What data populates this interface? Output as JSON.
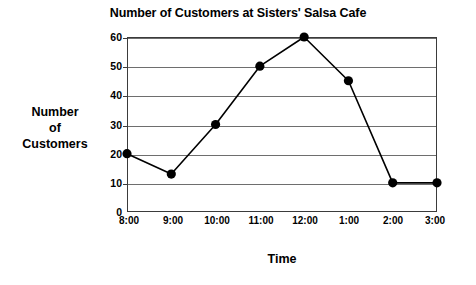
{
  "chart_data": {
    "type": "line",
    "title": "Number of Customers at Sisters' Salsa Cafe",
    "xlabel": "Time",
    "ylabel": "Number of Customers",
    "ylabel_lines": [
      "Number",
      "of",
      "Customers"
    ],
    "categories": [
      "8:00",
      "9:00",
      "10:00",
      "11:00",
      "12:00",
      "1:00",
      "2:00",
      "3:00"
    ],
    "values": [
      20,
      13,
      30,
      50,
      60,
      45,
      10,
      10
    ],
    "series": [
      {
        "name": "Number of Customers",
        "values": [
          20,
          13,
          30,
          50,
          60,
          45,
          10,
          10
        ]
      }
    ],
    "ylim": [
      0,
      60
    ],
    "yticks": [
      0,
      10,
      20,
      30,
      40,
      50,
      60
    ],
    "ytick_labels": [
      "0",
      "10",
      "20",
      "30",
      "40",
      "50",
      "60"
    ],
    "grid": true,
    "grid_axis": "y",
    "legend": false,
    "legend_position": "none",
    "marker": "filled-circle",
    "line_color": "#000000",
    "marker_color": "#000000",
    "grid_color": "#6e6e6e",
    "axis_color": "#3b3b3b",
    "background_color": "#ffffff"
  }
}
